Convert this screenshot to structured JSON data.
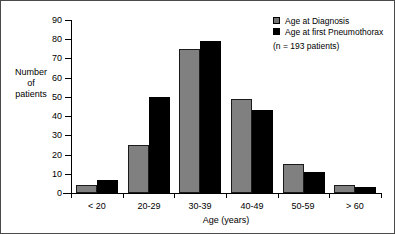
{
  "chart_data": {
    "type": "bar",
    "title": "",
    "subtitle": "",
    "categories": [
      "< 20",
      "20-29",
      "30-39",
      "40-49",
      "50-59",
      "> 60"
    ],
    "series": [
      {
        "name": "Age at Diagnosis",
        "color": "#808080",
        "values": [
          4,
          25,
          75,
          49,
          15,
          4
        ]
      },
      {
        "name": "Age at first Pneumothorax",
        "color": "#000000",
        "values": [
          7,
          50,
          79,
          43,
          11,
          3
        ]
      }
    ],
    "xlabel": "Age (years)",
    "ylabel": "Number of patients",
    "ylabel_lines": [
      "Number",
      "of",
      "patients"
    ],
    "ylim": [
      0,
      90
    ],
    "yticks": [
      0,
      10,
      20,
      30,
      40,
      50,
      60,
      70,
      80,
      90
    ],
    "ytick_labels": [
      "0",
      "10",
      "20",
      "30",
      "40",
      "50",
      "60",
      "70",
      "80",
      "90"
    ],
    "grid": false,
    "legend_position": "top-right",
    "annotations": [
      "(n = 193 patients)"
    ]
  },
  "legend": {
    "items": [
      {
        "label": "Age at Diagnosis"
      },
      {
        "label": "Age at first Pneumothorax"
      }
    ],
    "note": "(n = 193 patients)"
  }
}
